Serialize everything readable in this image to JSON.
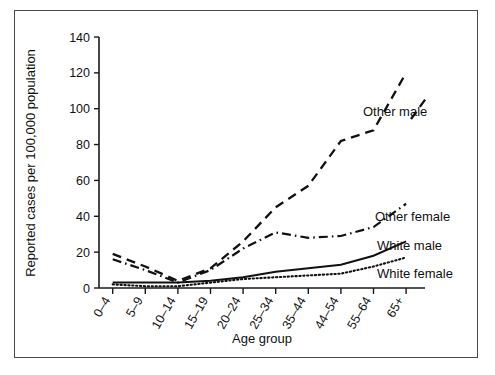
{
  "chart_data": {
    "type": "line",
    "title": "",
    "xlabel": "Age group",
    "ylabel": "Reported cases per 100,000 population",
    "categories": [
      "0–4",
      "5–9",
      "10–14",
      "15–19",
      "20–24",
      "25–34",
      "35–44",
      "44–54",
      "55–64",
      "65+"
    ],
    "ylim": [
      0,
      140
    ],
    "yticks": [
      0,
      20,
      40,
      60,
      80,
      100,
      120,
      140
    ],
    "ytick_labels": [
      "0",
      "20",
      "40",
      "60",
      "80",
      "100",
      "120",
      "140"
    ],
    "grid": false,
    "legend_position": "inline-right-of-lines",
    "series": [
      {
        "name": "Other male",
        "style": "dashed",
        "values": [
          19,
          12,
          4,
          11,
          26,
          45,
          57,
          82,
          88,
          120
        ]
      },
      {
        "name": "Other female",
        "style": "dash-dot",
        "values": [
          16,
          10,
          3,
          10,
          22,
          31,
          28,
          29,
          34,
          47
        ]
      },
      {
        "name": "White male",
        "style": "solid",
        "values": [
          3,
          3,
          3,
          4,
          6,
          9,
          11,
          13,
          18,
          26
        ]
      },
      {
        "name": "White female",
        "style": "dotted",
        "values": [
          2,
          1,
          1,
          3,
          5,
          6,
          7,
          8,
          12,
          17
        ]
      }
    ]
  },
  "labels": {
    "other_male": "Other male",
    "other_female": "Other female",
    "white_male": "White male",
    "white_female": "White female"
  }
}
